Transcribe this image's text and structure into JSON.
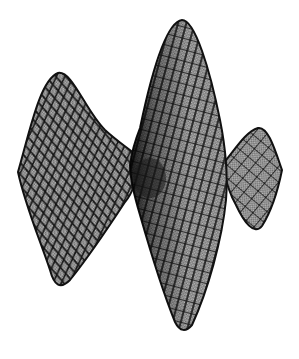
{
  "figure": {
    "type": "mesh-surface",
    "background": "#ffffff",
    "colors": {
      "outline": "#111111",
      "mesh_lines": "#1a1a1a",
      "fill": "#9a9a9a",
      "shadow": "#222222"
    },
    "lobes": [
      {
        "name": "left-lobe",
        "peak": [
          58,
          73
        ],
        "tip": [
          18,
          172
        ],
        "bottom": [
          58,
          285
        ]
      },
      {
        "name": "center-lobe",
        "peak": [
          182,
          20
        ],
        "bottom": [
          183,
          330
        ]
      },
      {
        "name": "right-lobe",
        "peak": [
          260,
          128
        ],
        "tip": [
          280,
          170
        ],
        "bottom": [
          258,
          228
        ]
      }
    ],
    "saddle_center": [
      150,
      175
    ]
  }
}
